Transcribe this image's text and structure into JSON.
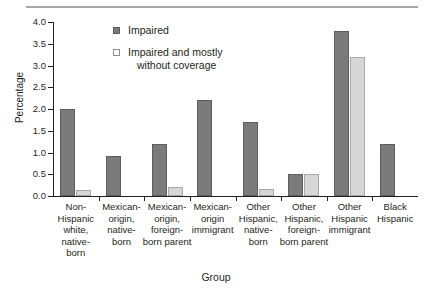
{
  "figure": {
    "rule_color": "#a6a6a6",
    "background": "#ffffff"
  },
  "chart_data": {
    "type": "bar",
    "title": "",
    "xlabel": "Group",
    "ylabel": "Percentage",
    "ylim": [
      0.0,
      4.0
    ],
    "ytick_labels": [
      "0.0",
      "0.5",
      "1.0",
      "1.5",
      "2.0",
      "2.5",
      "3.0",
      "3.5",
      "4.0"
    ],
    "ytick_values": [
      0.0,
      0.5,
      1.0,
      1.5,
      2.0,
      2.5,
      3.0,
      3.5,
      4.0
    ],
    "grid": false,
    "legend_position": "upper-left-inside",
    "categories": [
      "Non-Hispanic white, native-born",
      "Mexican-origin, native-born",
      "Mexican-origin, foreign-born parent",
      "Mexican-origin immigrant",
      "Other Hispanic, native-born",
      "Other Hispanic, foreign-born parent",
      "Other Hispanic immigrant",
      "Black Hispanic"
    ],
    "category_label_lines": [
      [
        "Non-",
        "Hispanic",
        "white,",
        "native-",
        "born"
      ],
      [
        "Mexican-",
        "origin,",
        "native-",
        "born"
      ],
      [
        "Mexican-",
        "origin,",
        "foreign-",
        "born parent"
      ],
      [
        "Mexican-",
        "origin",
        "immigrant"
      ],
      [
        "Other",
        "Hispanic,",
        "native-",
        "born"
      ],
      [
        "Other",
        "Hispanic,",
        "foreign-",
        "born parent"
      ],
      [
        "Other",
        "Hispanic",
        "immigrant"
      ],
      [
        "Black",
        "Hispanic"
      ]
    ],
    "series": [
      {
        "name": "Impaired",
        "color": "#7b7b7b",
        "values": [
          2.0,
          0.92,
          1.2,
          2.2,
          1.7,
          0.5,
          3.8,
          1.2
        ]
      },
      {
        "name": "Impaired and mostly without coverage",
        "name_line1": "Impaired and mostly",
        "name_line2": "without coverage",
        "color": "#d6d6d6",
        "values": [
          0.14,
          0.0,
          0.2,
          0.0,
          0.15,
          0.5,
          3.2,
          0.0
        ]
      }
    ]
  }
}
